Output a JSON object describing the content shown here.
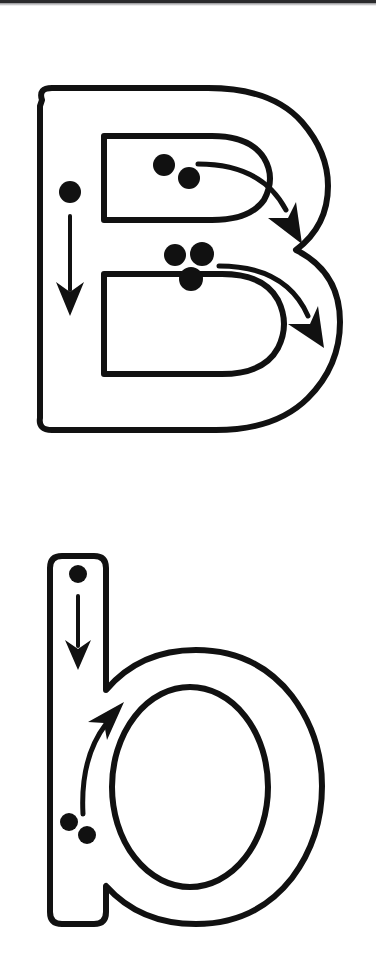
{
  "page": {
    "kind": "letter-tracing-worksheet",
    "width": 376,
    "height": 958,
    "background_color": "#ffffff",
    "ink_color": "#111111",
    "top_band_color": "#2a2a2c",
    "letter_name": "B",
    "letters": [
      {
        "id": "uppercase-b",
        "glyph": "B",
        "case": "uppercase",
        "outline_style": "hollow-block-outline",
        "stroke_count": 3,
        "strokes": [
          {
            "order": 1,
            "name": "vertical-down-stroke",
            "direction": "down",
            "start_dot_count": 1,
            "arrow": "straight-down"
          },
          {
            "order": 2,
            "name": "upper-bowl-stroke",
            "direction": "right-then-down-curve",
            "start_dot_count": 2,
            "arrow": "curved-right-down"
          },
          {
            "order": 3,
            "name": "lower-bowl-stroke",
            "direction": "right-then-down-curve",
            "start_dot_count": 3,
            "arrow": "curved-right-down"
          }
        ]
      },
      {
        "id": "lowercase-b",
        "glyph": "b",
        "case": "lowercase",
        "outline_style": "hollow-block-outline",
        "stroke_count": 2,
        "strokes": [
          {
            "order": 1,
            "name": "vertical-down-stroke",
            "direction": "down",
            "start_dot_count": 1,
            "arrow": "straight-down"
          },
          {
            "order": 2,
            "name": "bowl-stroke",
            "direction": "up-and-around",
            "start_dot_count": 2,
            "arrow": "curved-up"
          }
        ]
      }
    ]
  }
}
